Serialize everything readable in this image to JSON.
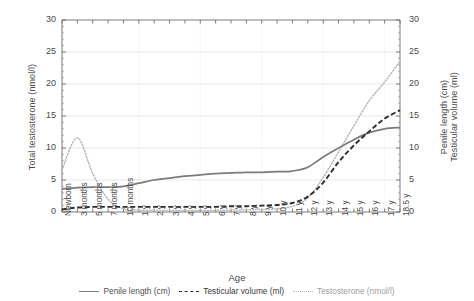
{
  "chart_data": {
    "type": "line",
    "title": "",
    "xlabel": "Age",
    "ylabel": "Total testosterone (nmol/l)",
    "ylabel_right_line1": "Penile length (cm)",
    "ylabel_right_line2": "Testicular volume (ml)",
    "ylim": [
      0,
      30
    ],
    "yticks": [
      0,
      5,
      10,
      15,
      20,
      25,
      30
    ],
    "ylim_right": [
      0,
      30
    ],
    "yticks_right": [
      0,
      5,
      10,
      15,
      20,
      25,
      30
    ],
    "grid": true,
    "legend_position": "bottom",
    "categories": [
      "Newborn",
      "3 months",
      "5 months",
      "7 months",
      "10 months",
      "1 y",
      "2 y",
      "3 y",
      "4 y",
      "5 y",
      "6 y",
      "7 y",
      "8 y",
      "9 y",
      "10 y",
      "11 y",
      "12 y",
      "13 y",
      "14 y",
      "15 y",
      "16 y",
      "17 y",
      "18.5 y"
    ],
    "series": [
      {
        "name": "Penile length (cm)",
        "style": "solid",
        "color": "#7b7b7b",
        "axis": "right",
        "values": [
          3.6,
          3.8,
          3.9,
          3.9,
          4.0,
          4.5,
          5.0,
          5.3,
          5.6,
          5.8,
          6.0,
          6.1,
          6.2,
          6.2,
          6.3,
          6.4,
          7.0,
          8.6,
          10.0,
          11.3,
          12.4,
          13.0,
          13.2
        ]
      },
      {
        "name": "Testicular volume (ml)",
        "style": "dashed",
        "color": "#2e2e2e",
        "axis": "right",
        "values": [
          0.4,
          0.7,
          0.8,
          0.8,
          0.8,
          0.8,
          0.8,
          0.8,
          0.8,
          0.8,
          0.8,
          0.9,
          0.9,
          1.0,
          1.1,
          1.4,
          2.4,
          4.6,
          7.8,
          10.4,
          12.6,
          14.6,
          15.9
        ]
      },
      {
        "name": "Testosterone (nmol/l)",
        "style": "dotted",
        "color": "#b9b9b9",
        "axis": "left",
        "values": [
          6.6,
          11.6,
          6.0,
          2.0,
          0.5,
          0.3,
          0.25,
          0.25,
          0.25,
          0.25,
          0.25,
          0.3,
          0.35,
          0.4,
          0.5,
          0.9,
          2.2,
          5.4,
          9.4,
          13.5,
          17.4,
          20.3,
          23.6
        ]
      }
    ],
    "legend": [
      {
        "label": "Penile length (cm)",
        "style": "solid"
      },
      {
        "label": "Testicular volume (ml)",
        "style": "dashed"
      },
      {
        "label": "Testosterone (nmol/l)",
        "style": "dotted"
      }
    ]
  }
}
